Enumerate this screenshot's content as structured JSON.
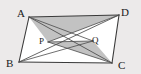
{
  "figure": {
    "shape_name": "parallelogram",
    "background_color": "#eceaea",
    "fill_color": "#ffffff",
    "stroke_color": "#3a3a3a",
    "shade_color": "#bfbfbf",
    "vertices": [
      {
        "name": "A",
        "label": "A",
        "x": 29,
        "y": 17
      },
      {
        "name": "D",
        "label": "D",
        "x": 119,
        "y": 15
      },
      {
        "name": "C",
        "label": "C",
        "x": 112,
        "y": 63
      },
      {
        "name": "B",
        "label": "B",
        "x": 19,
        "y": 62
      }
    ],
    "interior_points": [
      {
        "name": "P",
        "label": "P",
        "x": 48,
        "y": 42
      },
      {
        "name": "Q",
        "label": "Q",
        "x": 93,
        "y": 41
      }
    ],
    "sides": [
      {
        "name": "AD",
        "from": "A",
        "to": "D"
      },
      {
        "name": "DC",
        "from": "D",
        "to": "C"
      },
      {
        "name": "CB",
        "from": "C",
        "to": "B"
      },
      {
        "name": "BA",
        "from": "B",
        "to": "A"
      }
    ],
    "diagonals": [
      {
        "name": "AC",
        "from": "A",
        "to": "C"
      },
      {
        "name": "BD",
        "from": "B",
        "to": "D"
      }
    ],
    "cevians": [
      {
        "name": "AQ",
        "from": "A",
        "to": "Q"
      },
      {
        "name": "DP",
        "from": "D",
        "to": "P"
      },
      {
        "name": "BQ",
        "from": "B",
        "to": "Q"
      },
      {
        "name": "CP",
        "from": "C",
        "to": "P"
      },
      {
        "name": "PQ",
        "from": "P",
        "to": "Q"
      }
    ],
    "shaded_regions": [
      {
        "name": "triangle-A-P-D",
        "points": "A,P,D"
      },
      {
        "name": "triangle-P-C-Q",
        "points": "P,C,Q"
      }
    ]
  }
}
